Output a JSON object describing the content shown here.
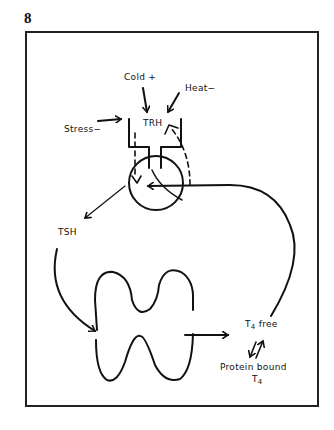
{
  "figure": {
    "number": "8"
  },
  "labels": {
    "cold": "Cold +",
    "heat": "Heat−",
    "stress": "Stress−",
    "trh": "TRH",
    "tsh": "TSH",
    "t4_free_main": "T",
    "t4_free_sub": "4",
    "t4_free_suffix": " free",
    "protein_bound": "Protein bound",
    "protein_t4_main": "T",
    "protein_t4_sub": "4"
  },
  "diagram": {
    "nodes": [
      "hypothalamus",
      "pituitary",
      "thyroid"
    ],
    "edges": [
      {
        "from": "Cold",
        "to": "hypothalamus",
        "sign": "+"
      },
      {
        "from": "Heat",
        "to": "hypothalamus",
        "sign": "-"
      },
      {
        "from": "Stress",
        "to": "hypothalamus",
        "sign": "-"
      },
      {
        "from": "hypothalamus",
        "to": "pituitary",
        "via": "TRH"
      },
      {
        "from": "pituitary",
        "to": "thyroid",
        "via": "TSH"
      },
      {
        "from": "thyroid",
        "to": "T4 free"
      },
      {
        "from": "T4 free",
        "to": "Protein bound T4",
        "bidirectional": true
      },
      {
        "from": "T4 free",
        "to": "pituitary",
        "type": "feedback"
      },
      {
        "from": "pituitary",
        "to": "hypothalamus",
        "type": "feedback-dashed"
      }
    ],
    "colors": {
      "ink": "#111111",
      "background": "#ffffff",
      "frame": "#222222"
    }
  }
}
